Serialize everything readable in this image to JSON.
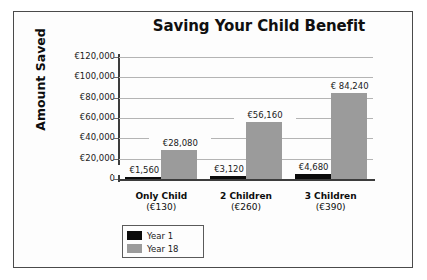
{
  "chart_data": {
    "type": "bar",
    "title": "Saving Your Child Benefit",
    "xlabel": "",
    "ylabel": "Amount Saved",
    "categories": [
      "Only Child",
      "2 Children",
      "3 Children"
    ],
    "category_sublabels": [
      "(€130)",
      "(€260)",
      "(€390)"
    ],
    "series": [
      {
        "name": "Year 1",
        "color": "#0b0b0b",
        "values": [
          1560,
          3120,
          4680
        ],
        "value_labels": [
          "€1,560",
          "€3,120",
          "€4,680"
        ]
      },
      {
        "name": "Year 18",
        "color": "#9b9b9b",
        "values": [
          28080,
          56160,
          84240
        ],
        "value_labels": [
          "€28,080",
          "€56,160",
          "€ 84,240"
        ]
      }
    ],
    "ylim": [
      0,
      120000
    ],
    "ytick_values": [
      120000,
      100000,
      80000,
      60000,
      40000,
      20000,
      0
    ],
    "ytick_labels": [
      "€120,000",
      "€100,000",
      "€80,000",
      "€60,000",
      "€40,000",
      "€20,000",
      "0"
    ],
    "grid": true,
    "legend_position": "bottom-left"
  }
}
